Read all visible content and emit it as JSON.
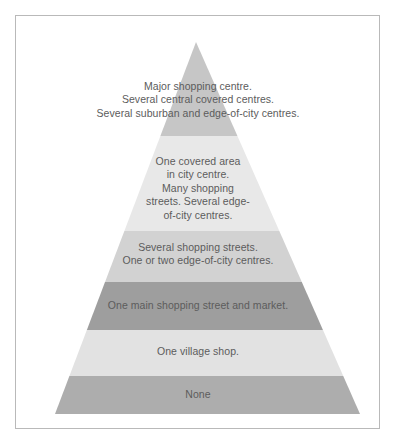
{
  "figure": {
    "kind": "pyramid-diagram",
    "background_color": "#ffffff",
    "frame_border_color": "#b9b9b9",
    "text_color": "#5c5c5c"
  },
  "pyramid": {
    "apex": {
      "x": 196,
      "y": 42
    },
    "base_left_x": 55,
    "base_right_x": 360,
    "base_y": 414,
    "band_boundaries_y": [
      42,
      136,
      231,
      282,
      330,
      376,
      414
    ],
    "bands": [
      {
        "index": 1,
        "name": "major-shopping-centre-band",
        "fill": "#c6c6c6",
        "text": "Major shopping centre.\nSeveral central covered centres.\nSeveral suburban and edge-of-city centres.",
        "lines": [
          "Major shopping centre.",
          "Several central covered centres.",
          "Several suburban and edge-of-city centres."
        ]
      },
      {
        "index": 2,
        "name": "covered-area-city-centre-band",
        "fill": "#e8e8e8",
        "text": "One covered area\nin city centre.\nMany shopping\nstreets. Several edge-\nof-city centres.",
        "lines": [
          "One covered area",
          "in city centre.",
          "Many shopping",
          "streets. Several edge-",
          "of-city centres."
        ]
      },
      {
        "index": 3,
        "name": "several-shopping-streets-band",
        "fill": "#d2d2d2",
        "text": "Several shopping streets.\nOne or two edge-of-city centres.",
        "lines": [
          "Several shopping streets.",
          "One or two edge-of-city centres."
        ]
      },
      {
        "index": 4,
        "name": "one-main-shopping-street-band",
        "fill": "#9e9e9e",
        "text": "One main shopping street and market.",
        "lines": [
          "One main shopping street and market."
        ]
      },
      {
        "index": 5,
        "name": "one-village-shop-band",
        "fill": "#e2e2e2",
        "text": "One village shop.",
        "lines": [
          "One village shop."
        ]
      },
      {
        "index": 6,
        "name": "none-band",
        "fill": "#adadad",
        "text": "None",
        "lines": [
          "None"
        ]
      }
    ]
  }
}
